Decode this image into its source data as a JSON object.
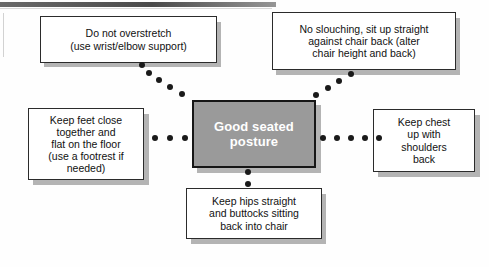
{
  "diagram": {
    "center_node": {
      "id": "center",
      "label": "Good seated posture",
      "fill": "#9a9a9a",
      "text_color": "#ffffff",
      "border_color": "#161616"
    },
    "nodes": [
      {
        "id": "top-left",
        "label": "Do not overstretch (use wrist/elbow support)",
        "lines": [
          "Do not overstretch",
          "(use wrist/elbow support)"
        ],
        "position": "top-left",
        "fill": "#ffffff",
        "text_color": "#111111"
      },
      {
        "id": "top-right",
        "label": "No slouching, sit up straight against chair back (alter chair height and back)",
        "lines": [
          "No slouching, sit up straight",
          "against chair back (alter",
          "chair height and back)"
        ],
        "position": "top-right",
        "fill": "#ffffff",
        "text_color": "#111111"
      },
      {
        "id": "left",
        "label": "Keep feet close together and flat on the floor (use a footrest if needed)",
        "lines": [
          "Keep feet close",
          "together and",
          "flat on the floor",
          "(use a footrest if",
          "needed)"
        ],
        "position": "left",
        "fill": "#ffffff",
        "text_color": "#111111"
      },
      {
        "id": "right",
        "label": "Keep chest up with shoulders back",
        "lines": [
          "Keep chest",
          "up with",
          "shoulders",
          "back"
        ],
        "position": "right",
        "fill": "#ffffff",
        "text_color": "#111111"
      },
      {
        "id": "bottom",
        "label": "Keep hips straight and buttocks sitting back into chair",
        "lines": [
          "Keep hips straight",
          "and buttocks sitting",
          "back into chair"
        ],
        "position": "bottom",
        "fill": "#ffffff",
        "text_color": "#111111"
      }
    ],
    "connectors": [
      {
        "id": "center-to-top-left",
        "style": "dotted",
        "dot_count": 5,
        "dot_color": "#1a1a1a"
      },
      {
        "id": "center-to-top-right",
        "style": "dotted",
        "dot_count": 4,
        "dot_color": "#1a1a1a"
      },
      {
        "id": "center-to-left",
        "style": "dotted",
        "dot_count": 3,
        "dot_color": "#1a1a1a"
      },
      {
        "id": "center-to-right",
        "style": "dotted",
        "dot_count": 5,
        "dot_color": "#1a1a1a"
      },
      {
        "id": "center-to-bottom",
        "style": "dotted",
        "dot_count": 2,
        "dot_color": "#1a1a1a"
      }
    ]
  }
}
